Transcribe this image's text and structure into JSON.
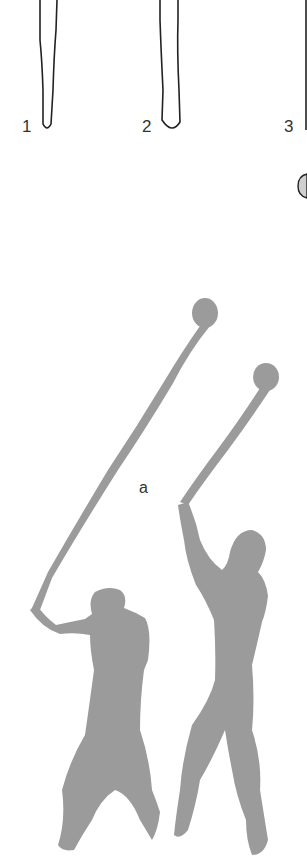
{
  "figure": {
    "club_outline_labels": [
      "1",
      "2",
      "3"
    ],
    "scene_label": "a",
    "colors": {
      "background": "#ffffff",
      "outline": "#222222",
      "silhouette": "#9b9b9b",
      "label": "#333333"
    }
  }
}
